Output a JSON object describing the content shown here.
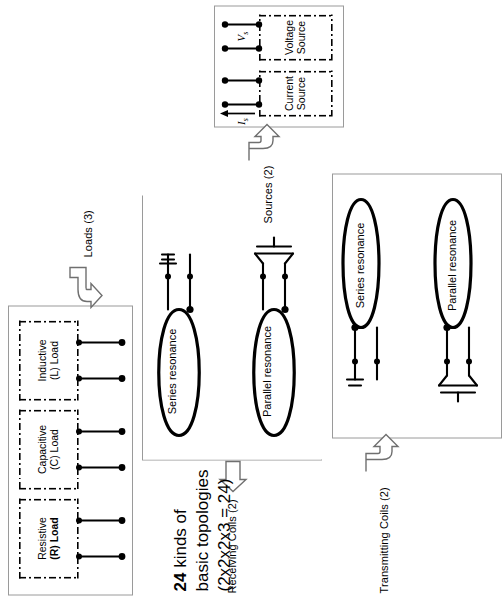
{
  "diagram": {
    "title_lines": [
      "24 kinds of",
      "basic topologies",
      "(2x2x2x3 = 24)"
    ],
    "title_bold_prefix": "24",
    "title_rest_line1": " kinds of"
  },
  "loads_panel": {
    "group_label": "Loads (3)",
    "boxes": [
      {
        "line1": "Resistive",
        "line2": "(R) Load",
        "bold_line2": true
      },
      {
        "line1": "Capacitive",
        "line2": "(C) Load",
        "bold_line2": false
      },
      {
        "line1": "Inductive",
        "line2": "(L) Load",
        "bold_line2": false
      }
    ]
  },
  "receiving_panel": {
    "group_label": "Receiving Coils (2)",
    "coils": [
      {
        "label": "Series resonance",
        "element": "series-capacitor"
      },
      {
        "label": "Parallel resonance",
        "element": "parallel-capacitor"
      }
    ]
  },
  "transmitting_panel": {
    "group_label": "Transmitting Coils (2)",
    "coils": [
      {
        "label": "Series resonance",
        "element": "series-capacitor"
      },
      {
        "label": "Parallel resonance",
        "element": "parallel-capacitor"
      }
    ]
  },
  "sources_panel": {
    "group_label": "Sources (2)",
    "boxes": [
      {
        "line1": "Current",
        "line2": "Source",
        "symbol": "I_s",
        "symbol_main": "I",
        "symbol_sub": "s"
      },
      {
        "line1": "Voltage",
        "line2": "Source",
        "symbol": "V_s",
        "symbol_main": "V",
        "symbol_sub": "s"
      }
    ]
  },
  "colors": {
    "ink": "#000000",
    "panel_border": "#9a9a9a",
    "arrow_outline": "#6f6f6f",
    "background": "#ffffff"
  }
}
